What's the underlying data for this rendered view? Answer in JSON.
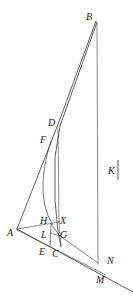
{
  "figure": {
    "type": "geometric-diagram",
    "width": 133,
    "height": 303,
    "background_color": "#ffffff",
    "ink_color": "#2a2a2a",
    "labels": [
      {
        "id": "B",
        "text": "B",
        "x": 86,
        "y": 12
      },
      {
        "id": "D",
        "text": "D",
        "x": 48,
        "y": 118
      },
      {
        "id": "F",
        "text": "F",
        "x": 40,
        "y": 135
      },
      {
        "id": "K",
        "text": "K",
        "x": 108,
        "y": 166
      },
      {
        "id": "H",
        "text": "H",
        "x": 40,
        "y": 216
      },
      {
        "id": "X",
        "text": "X",
        "x": 60,
        "y": 216
      },
      {
        "id": "A",
        "text": "A",
        "x": 7,
        "y": 228
      },
      {
        "id": "L",
        "text": "L",
        "x": 41,
        "y": 230
      },
      {
        "id": "G",
        "text": "G",
        "x": 60,
        "y": 230
      },
      {
        "id": "E",
        "text": "E",
        "x": 39,
        "y": 247
      },
      {
        "id": "C",
        "text": "C",
        "x": 52,
        "y": 249
      },
      {
        "id": "N",
        "text": "N",
        "x": 107,
        "y": 256
      },
      {
        "id": "M",
        "text": "M",
        "x": 96,
        "y": 275
      }
    ],
    "points": {
      "B": {
        "x": 96,
        "y": 21
      },
      "D": {
        "x": 57,
        "y": 127
      },
      "F": {
        "x": 50,
        "y": 142
      },
      "A": {
        "x": 17,
        "y": 229
      },
      "H": {
        "x": 52,
        "y": 224
      },
      "X": {
        "x": 59,
        "y": 222
      },
      "L": {
        "x": 50,
        "y": 234
      },
      "G": {
        "x": 59,
        "y": 234
      },
      "E": {
        "x": 50,
        "y": 245
      },
      "C": {
        "x": 61,
        "y": 246
      },
      "N": {
        "x": 98,
        "y": 263
      },
      "M": {
        "x": 92,
        "y": 270
      },
      "K_tick_top": {
        "x": 118,
        "y": 160
      },
      "K_tick_bottom": {
        "x": 118,
        "y": 180
      }
    },
    "segments": [
      {
        "name": "segment-B-to-M",
        "from": "B",
        "to": "M"
      },
      {
        "name": "segment-B-to-C",
        "from": "B",
        "to": "C"
      },
      {
        "name": "segment-B-to-N",
        "from": "B",
        "to": "N"
      },
      {
        "name": "segment-A-to-D",
        "from": "A",
        "to": "D"
      },
      {
        "name": "segment-A-to-X",
        "from": "A",
        "to": "X"
      },
      {
        "name": "segment-A-to-M",
        "from": "A",
        "to": "M"
      },
      {
        "name": "segment-H-to-E",
        "from": "H",
        "to": "E"
      },
      {
        "name": "segment-X-to-C",
        "from": "X",
        "to": "C"
      },
      {
        "name": "segment-H-to-G",
        "from": "H",
        "to": "G"
      },
      {
        "name": "segment-L-to-G",
        "from": "L",
        "to": "G"
      },
      {
        "name": "segment-N-vertical",
        "from": "B",
        "to": "N"
      },
      {
        "name": "segment-K-tick",
        "from": "K_tick_top",
        "to": "K_tick_bottom"
      }
    ],
    "arc": {
      "name": "curve-F-to-H",
      "description": "concave arc bulging left from F down to H"
    },
    "baseline": {
      "name": "baseline-A-through-M",
      "description": "long diagonal from A past N and M to lower-right edge"
    }
  }
}
